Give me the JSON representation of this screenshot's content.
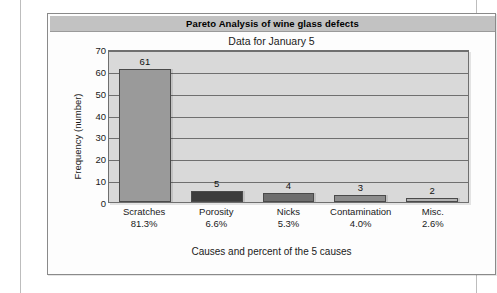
{
  "chart_data": {
    "type": "bar",
    "title": "Pareto Analysis of wine glass defects",
    "subtitle": "Data for January 5",
    "xlabel": "Causes and percent of the 5 causes",
    "ylabel": "Frequency (number)",
    "categories": [
      "Scratches",
      "Porosity",
      "Nicks",
      "Contamination",
      "Misc."
    ],
    "percents": [
      "81.3%",
      "6.6%",
      "5.3%",
      "4.0%",
      "2.6%"
    ],
    "values": [
      61,
      5,
      4,
      3,
      2
    ],
    "value_labels": [
      "61",
      "5",
      "4",
      "3",
      "2"
    ],
    "bar_colors": [
      "#9a9a9a",
      "#3c3c3c",
      "#6e6e6e",
      "#8d8d8d",
      "#b2b2b2"
    ],
    "ylim": [
      0,
      70
    ],
    "yticks": [
      70,
      60,
      50,
      40,
      30,
      20,
      10,
      0
    ],
    "ytick_labels": [
      "70",
      "60",
      "50",
      "40",
      "30",
      "20",
      "10",
      "0"
    ],
    "grid": true,
    "legend": "none",
    "title_bar_color": "#c2c2c2",
    "plot_background": "#d9d9d9",
    "axis_color": "#6f6f6f"
  }
}
